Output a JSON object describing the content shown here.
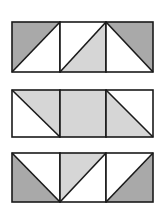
{
  "diagram": {
    "title": "",
    "colors": {
      "dark": "#a9a9a9",
      "light": "#d6d6d6",
      "white": "#ffffff",
      "stroke": "#1a1a1a"
    },
    "rows": [
      {
        "y": 22,
        "h": 50,
        "cells": [
          {
            "diag": "bl-tr",
            "upper": "dark",
            "lower": "white"
          },
          {
            "diag": "bl-tr",
            "upper": "white",
            "lower": "light"
          },
          {
            "diag": "tl-br",
            "upper": "dark",
            "lower": "white"
          }
        ]
      },
      {
        "y": 90,
        "h": 47,
        "cells": [
          {
            "diag": "tl-br",
            "upper": "light",
            "lower": "white"
          },
          {
            "diag": "none",
            "fill": "light"
          },
          {
            "diag": "tl-br",
            "upper": "white",
            "lower": "light"
          }
        ]
      },
      {
        "y": 153,
        "h": 49,
        "cells": [
          {
            "diag": "tl-br",
            "upper": "white",
            "lower": "dark"
          },
          {
            "diag": "bl-tr",
            "upper": "light",
            "lower": "white"
          },
          {
            "diag": "bl-tr",
            "upper": "white",
            "lower": "dark"
          }
        ]
      }
    ],
    "columns_x": [
      12,
      60,
      106,
      153
    ]
  }
}
